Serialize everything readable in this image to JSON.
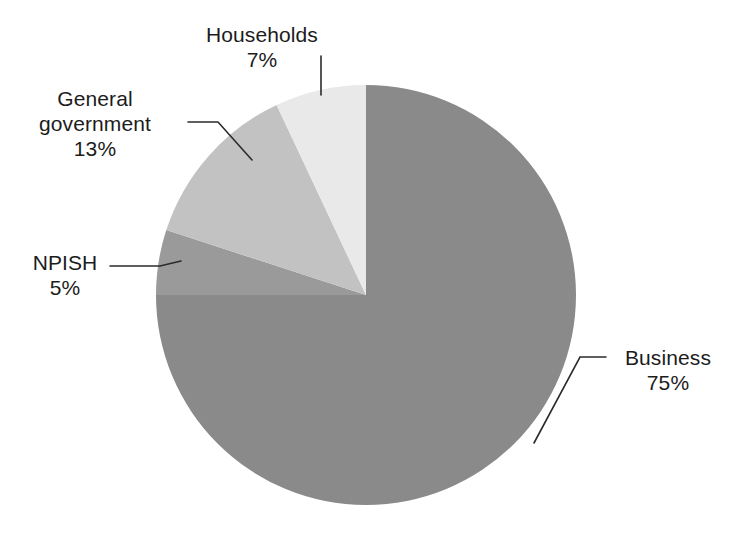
{
  "chart_data": {
    "type": "pie",
    "title": "",
    "subtitle": "",
    "xlabel": "",
    "ylabel": "",
    "legend_position": "none",
    "grid": false,
    "start_angle_deg": 0,
    "direction": "clockwise",
    "categories": [
      "Business",
      "NPISH",
      "General government",
      "Households"
    ],
    "values": [
      75,
      5,
      13,
      7
    ],
    "value_unit": "%",
    "slices": [
      {
        "label": "Business",
        "value": 75,
        "value_label": "75%",
        "color": "#8a8a8a",
        "start_deg": 0,
        "end_deg": 270,
        "callout": true
      },
      {
        "label": "NPISH",
        "value": 5,
        "value_label": "5%",
        "color": "#9a9a9a",
        "start_deg": 270,
        "end_deg": 288,
        "callout": true
      },
      {
        "label": "General government",
        "value": 13,
        "value_label": "13%",
        "color": "#c2c2c2",
        "start_deg": 288,
        "end_deg": 334.8,
        "callout": true
      },
      {
        "label": "Households",
        "value": 7,
        "value_label": "7%",
        "color": "#e9e9e9",
        "start_deg": 334.8,
        "end_deg": 360,
        "callout": true
      }
    ],
    "annotations": []
  },
  "figure": {
    "background_color": "#ffffff",
    "text_color": "#1c1c1c",
    "leader_line_color": "#2b2b2b",
    "center_x": 366,
    "center_y": 295,
    "radius": 210
  },
  "labels": {
    "households": {
      "name": "Households",
      "value": "7%"
    },
    "general_government": {
      "name_line1": "General",
      "name_line2": "government",
      "value": "13%"
    },
    "npish": {
      "name": "NPISH",
      "value": "5%"
    },
    "business": {
      "name": "Business",
      "value": "75%"
    }
  }
}
